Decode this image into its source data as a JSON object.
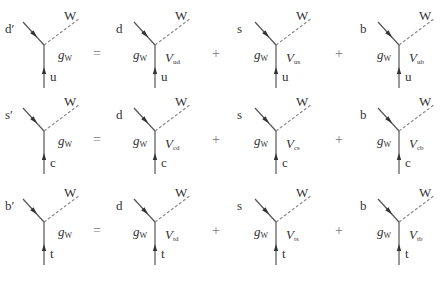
{
  "boson": "W",
  "coupling": {
    "symbol": "g",
    "subscript": "W"
  },
  "matrix_symbol": "V",
  "operators": {
    "equals": "=",
    "plus": "+"
  },
  "rows": [
    {
      "lhs": {
        "incoming": "d′",
        "outgoing": "u"
      },
      "terms": [
        {
          "quark": "d",
          "up": "u",
          "element": "ud"
        },
        {
          "quark": "s",
          "up": "u",
          "element": "us"
        },
        {
          "quark": "b",
          "up": "u",
          "element": "ub"
        }
      ]
    },
    {
      "lhs": {
        "incoming": "s′",
        "outgoing": "c"
      },
      "terms": [
        {
          "quark": "d",
          "up": "c",
          "element": "cd"
        },
        {
          "quark": "s",
          "up": "c",
          "element": "cs"
        },
        {
          "quark": "b",
          "up": "c",
          "element": "cb"
        }
      ]
    },
    {
      "lhs": {
        "incoming": "b′",
        "outgoing": "t"
      },
      "terms": [
        {
          "quark": "d",
          "up": "t",
          "element": "td"
        },
        {
          "quark": "s",
          "up": "t",
          "element": "ts"
        },
        {
          "quark": "b",
          "up": "t",
          "element": "tb"
        }
      ]
    }
  ],
  "colors": {
    "line": "#555555",
    "dashed": "#888888",
    "text": "#333333"
  }
}
